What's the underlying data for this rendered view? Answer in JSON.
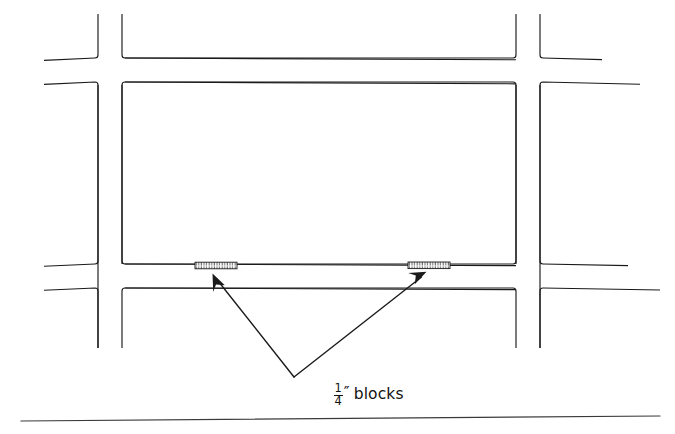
{
  "figure": {
    "kind": "line-drawing",
    "background_color": "#ffffff",
    "line_color": "#1a1a1a",
    "width": 675,
    "height": 434
  },
  "caption": {
    "fraction_numerator": "1",
    "fraction_denominator": "4",
    "prime_symbol": "″",
    "text": "blocks",
    "full_text": "1/4″ blocks"
  },
  "roads": {
    "note": "Each road is drawn as a pair of parallel lines; intersections are formed by four mitred corner pieces.",
    "vertical": [
      {
        "name": "left-vertical-road",
        "left_edge_x": 98,
        "right_edge_x": 122,
        "top_y": 14,
        "bottom_y": 348
      },
      {
        "name": "right-vertical-road",
        "left_edge_x": 516,
        "right_edge_x": 540,
        "top_y": 14,
        "bottom_y": 348
      }
    ],
    "horizontal": [
      {
        "name": "top-horizontal-road",
        "top_edge_y": 58,
        "bottom_edge_y": 82,
        "left_x": 44,
        "right_x": 640
      },
      {
        "name": "bottom-horizontal-road",
        "top_edge_y": 264,
        "bottom_edge_y": 288,
        "left_x": 44,
        "right_x": 640
      }
    ],
    "intersections": [
      {
        "name": "top-left-intersection",
        "cx": 110,
        "cy": 70
      },
      {
        "name": "top-right-intersection",
        "cx": 528,
        "cy": 70
      },
      {
        "name": "bottom-left-intersection",
        "cx": 110,
        "cy": 276
      },
      {
        "name": "bottom-right-intersection",
        "cx": 528,
        "cy": 276
      }
    ]
  },
  "blocks": [
    {
      "name": "left-block",
      "x": 195,
      "y": 262,
      "width": 42,
      "height": 7,
      "hatch": "vertical-ticks"
    },
    {
      "name": "right-block",
      "x": 408,
      "y": 262,
      "width": 42,
      "height": 7,
      "hatch": "vertical-ticks"
    }
  ],
  "leaders": {
    "vertex": {
      "x": 294,
      "y": 377
    },
    "arrows": [
      {
        "name": "left-leader-arrow",
        "tip_x": 214,
        "tip_y": 276,
        "from_x": 294,
        "from_y": 377
      },
      {
        "name": "right-leader-arrow",
        "tip_x": 424,
        "tip_y": 274,
        "from_x": 294,
        "from_y": 377
      }
    ]
  },
  "base_rule": {
    "name": "bottom-horizontal-rule",
    "x1": 21,
    "y1": 421,
    "x2": 660,
    "y2": 416
  }
}
